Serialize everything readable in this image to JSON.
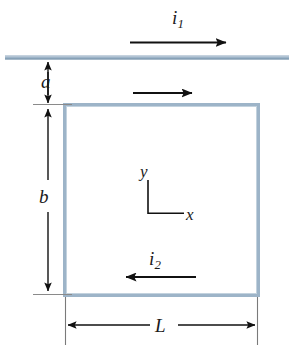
{
  "figure": {
    "background_color": "#ffffff",
    "width": 296,
    "height": 353
  },
  "colors": {
    "conductor": "#9db4c8",
    "conductor_dark": "#7e99b0",
    "arrow": "#111111",
    "dimension_line": "#111111",
    "extension_line": "#8a8a8a",
    "label_text": "#1a1a1a"
  },
  "labels": {
    "current_wire": {
      "symbol": "i",
      "subscript": "1"
    },
    "current_loop": {
      "symbol": "i",
      "subscript": "2"
    },
    "gap": "a",
    "height": "b",
    "width": "L",
    "axis_x": "x",
    "axis_y": "y"
  },
  "elements": {
    "straight_wire": {
      "name": "long-straight-wire",
      "orientation": "horizontal"
    },
    "loop": {
      "name": "rectangular-loop",
      "shape": "rectangle"
    },
    "current_arrow_wire": {
      "direction": "right"
    },
    "current_arrow_loop_top": {
      "direction": "right"
    },
    "current_arrow_loop_bottom": {
      "direction": "left"
    },
    "dimension_a": {
      "direction": "vertical",
      "arrowheads": "both"
    },
    "dimension_b": {
      "direction": "vertical",
      "arrowheads": "both"
    },
    "dimension_L": {
      "direction": "horizontal",
      "arrowheads": "both"
    },
    "axes": {
      "x_direction": "right",
      "y_direction": "up"
    }
  }
}
